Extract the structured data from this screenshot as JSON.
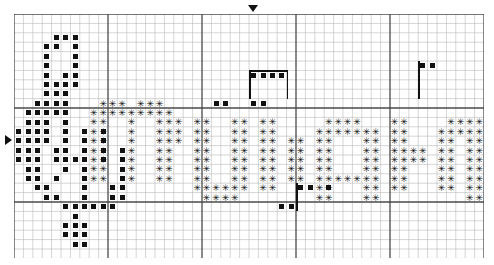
{
  "document": {
    "type": "cross-stitch-pattern-chart",
    "title": "Cross Stitch Pattern Chart",
    "background_color": "#ffffff",
    "symbol_color": "#111111"
  },
  "grid": {
    "columns": 50,
    "rows": 26,
    "cell_size": 9.4,
    "origin_x": 14,
    "origin_y": 14,
    "light_line_color": "#b9b9b9",
    "heavy_line_color": "#4a4a4a",
    "heavy_every": 10,
    "light_width": 0.6,
    "heavy_width": 1.3
  },
  "legend": {
    "symbols": [
      {
        "key": "sq",
        "glyph": "■",
        "name": "filled-square-stitch",
        "color": "#111111"
      },
      {
        "key": "ast",
        "glyph": "✳",
        "name": "asterisk-stitch",
        "color": "#111111"
      }
    ]
  },
  "markers": [
    {
      "name": "center-marker-top",
      "edge": "top",
      "col": 25,
      "icon": "triangle-down-icon"
    },
    {
      "name": "center-marker-left",
      "edge": "left",
      "row": 13,
      "icon": "triangle-right-icon"
    }
  ],
  "backstitch": [
    {
      "name": "backstitch-top-box",
      "type": "h",
      "col": 25,
      "row": 6,
      "length": 4
    },
    {
      "name": "backstitch-top-box-left",
      "type": "v",
      "col": 25,
      "row": 6,
      "length": 3
    },
    {
      "name": "backstitch-top-box-right",
      "type": "v",
      "col": 29,
      "row": 6,
      "length": 3
    },
    {
      "name": "backstitch-right-stem",
      "type": "v",
      "col": 43,
      "row": 5,
      "length": 4
    },
    {
      "name": "backstitch-lower-stem",
      "type": "v",
      "col": 30,
      "row": 18,
      "length": 3
    }
  ],
  "chart_data": {
    "type": "heatmap",
    "xlabel": "",
    "ylabel": "",
    "legend": [
      "filled-square",
      "asterisk"
    ],
    "categories": [],
    "values": [],
    "stitches_sq": [
      [
        4,
        2
      ],
      [
        5,
        2
      ],
      [
        6,
        2
      ],
      [
        3,
        3
      ],
      [
        4,
        3
      ],
      [
        6,
        3
      ],
      [
        3,
        4
      ],
      [
        6,
        4
      ],
      [
        3,
        5
      ],
      [
        6,
        5
      ],
      [
        3,
        6
      ],
      [
        5,
        6
      ],
      [
        6,
        6
      ],
      [
        3,
        7
      ],
      [
        4,
        7
      ],
      [
        5,
        7
      ],
      [
        6,
        7
      ],
      [
        3,
        8
      ],
      [
        4,
        8
      ],
      [
        5,
        8
      ],
      [
        2,
        9
      ],
      [
        3,
        9
      ],
      [
        4,
        9
      ],
      [
        5,
        9
      ],
      [
        1,
        10
      ],
      [
        2,
        10
      ],
      [
        3,
        10
      ],
      [
        4,
        10
      ],
      [
        5,
        10
      ],
      [
        1,
        11
      ],
      [
        2,
        11
      ],
      [
        3,
        11
      ],
      [
        5,
        11
      ],
      [
        0,
        12
      ],
      [
        1,
        12
      ],
      [
        2,
        12
      ],
      [
        3,
        12
      ],
      [
        5,
        12
      ],
      [
        7,
        12
      ],
      [
        9,
        12
      ],
      [
        0,
        13
      ],
      [
        1,
        13
      ],
      [
        2,
        13
      ],
      [
        3,
        13
      ],
      [
        5,
        13
      ],
      [
        7,
        13
      ],
      [
        9,
        13
      ],
      [
        0,
        14
      ],
      [
        1,
        14
      ],
      [
        2,
        14
      ],
      [
        4,
        14
      ],
      [
        5,
        14
      ],
      [
        7,
        14
      ],
      [
        9,
        14
      ],
      [
        11,
        14
      ],
      [
        0,
        15
      ],
      [
        1,
        15
      ],
      [
        2,
        15
      ],
      [
        4,
        15
      ],
      [
        5,
        15
      ],
      [
        6,
        15
      ],
      [
        7,
        15
      ],
      [
        9,
        15
      ],
      [
        11,
        15
      ],
      [
        1,
        16
      ],
      [
        2,
        16
      ],
      [
        5,
        16
      ],
      [
        7,
        16
      ],
      [
        11,
        16
      ],
      [
        1,
        17
      ],
      [
        2,
        17
      ],
      [
        4,
        17
      ],
      [
        7,
        17
      ],
      [
        11,
        17
      ],
      [
        2,
        18
      ],
      [
        3,
        18
      ],
      [
        7,
        18
      ],
      [
        10,
        18
      ],
      [
        11,
        18
      ],
      [
        3,
        19
      ],
      [
        4,
        19
      ],
      [
        7,
        19
      ],
      [
        10,
        19
      ],
      [
        11,
        19
      ],
      [
        5,
        20
      ],
      [
        6,
        20
      ],
      [
        7,
        20
      ],
      [
        8,
        20
      ],
      [
        9,
        20
      ],
      [
        10,
        20
      ],
      [
        6,
        21
      ],
      [
        5,
        22
      ],
      [
        6,
        22
      ],
      [
        7,
        22
      ],
      [
        5,
        23
      ],
      [
        6,
        23
      ],
      [
        7,
        23
      ],
      [
        6,
        24
      ],
      [
        7,
        24
      ],
      [
        25,
        6
      ],
      [
        26,
        6
      ],
      [
        27,
        6
      ],
      [
        28,
        6
      ],
      [
        21,
        9
      ],
      [
        22,
        9
      ],
      [
        25,
        9
      ],
      [
        26,
        9
      ],
      [
        43,
        5
      ],
      [
        44,
        5
      ],
      [
        30,
        18
      ],
      [
        31,
        18
      ],
      [
        33,
        18
      ],
      [
        28,
        20
      ],
      [
        29,
        20
      ]
    ],
    "stitches_ast": [
      [
        9,
        9
      ],
      [
        10,
        9
      ],
      [
        11,
        9
      ],
      [
        13,
        9
      ],
      [
        14,
        9
      ],
      [
        15,
        9
      ],
      [
        8,
        10
      ],
      [
        9,
        10
      ],
      [
        10,
        10
      ],
      [
        11,
        10
      ],
      [
        12,
        10
      ],
      [
        13,
        10
      ],
      [
        14,
        10
      ],
      [
        15,
        10
      ],
      [
        16,
        10
      ],
      [
        8,
        11
      ],
      [
        9,
        11
      ],
      [
        12,
        11
      ],
      [
        15,
        11
      ],
      [
        16,
        11
      ],
      [
        19,
        11
      ],
      [
        20,
        11
      ],
      [
        23,
        11
      ],
      [
        24,
        11
      ],
      [
        33,
        11
      ],
      [
        34,
        11
      ],
      [
        35,
        11
      ],
      [
        36,
        11
      ],
      [
        46,
        11
      ],
      [
        47,
        11
      ],
      [
        48,
        11
      ],
      [
        49,
        11
      ],
      [
        8,
        12
      ],
      [
        9,
        12
      ],
      [
        12,
        12
      ],
      [
        15,
        12
      ],
      [
        16,
        12
      ],
      [
        19,
        12
      ],
      [
        20,
        12
      ],
      [
        23,
        12
      ],
      [
        24,
        12
      ],
      [
        32,
        12
      ],
      [
        33,
        12
      ],
      [
        34,
        12
      ],
      [
        35,
        12
      ],
      [
        36,
        12
      ],
      [
        37,
        12
      ],
      [
        38,
        12
      ],
      [
        45,
        12
      ],
      [
        46,
        12
      ],
      [
        47,
        12
      ],
      [
        48,
        12
      ],
      [
        49,
        12
      ],
      [
        8,
        13
      ],
      [
        9,
        13
      ],
      [
        12,
        13
      ],
      [
        15,
        13
      ],
      [
        16,
        13
      ],
      [
        19,
        13
      ],
      [
        20,
        13
      ],
      [
        23,
        13
      ],
      [
        24,
        13
      ],
      [
        32,
        13
      ],
      [
        33,
        13
      ],
      [
        37,
        13
      ],
      [
        38,
        13
      ],
      [
        45,
        13
      ],
      [
        46,
        13
      ],
      [
        48,
        13
      ],
      [
        49,
        13
      ],
      [
        8,
        14
      ],
      [
        9,
        14
      ],
      [
        12,
        14
      ],
      [
        15,
        14
      ],
      [
        16,
        14
      ],
      [
        19,
        14
      ],
      [
        20,
        14
      ],
      [
        23,
        14
      ],
      [
        24,
        14
      ],
      [
        32,
        14
      ],
      [
        33,
        14
      ],
      [
        37,
        14
      ],
      [
        38,
        14
      ],
      [
        45,
        14
      ],
      [
        46,
        14
      ],
      [
        48,
        14
      ],
      [
        49,
        14
      ],
      [
        8,
        15
      ],
      [
        9,
        15
      ],
      [
        12,
        15
      ],
      [
        15,
        15
      ],
      [
        16,
        15
      ],
      [
        19,
        15
      ],
      [
        20,
        15
      ],
      [
        23,
        15
      ],
      [
        24,
        15
      ],
      [
        32,
        15
      ],
      [
        33,
        15
      ],
      [
        37,
        15
      ],
      [
        38,
        15
      ],
      [
        45,
        15
      ],
      [
        46,
        15
      ],
      [
        48,
        15
      ],
      [
        49,
        15
      ],
      [
        8,
        16
      ],
      [
        9,
        16
      ],
      [
        12,
        16
      ],
      [
        15,
        16
      ],
      [
        16,
        16
      ],
      [
        19,
        16
      ],
      [
        20,
        16
      ],
      [
        23,
        16
      ],
      [
        24,
        16
      ],
      [
        32,
        16
      ],
      [
        33,
        16
      ],
      [
        37,
        16
      ],
      [
        38,
        16
      ],
      [
        45,
        16
      ],
      [
        46,
        16
      ],
      [
        48,
        16
      ],
      [
        49,
        16
      ],
      [
        8,
        17
      ],
      [
        9,
        17
      ],
      [
        12,
        17
      ],
      [
        15,
        17
      ],
      [
        16,
        17
      ],
      [
        19,
        17
      ],
      [
        20,
        17
      ],
      [
        23,
        17
      ],
      [
        24,
        17
      ],
      [
        32,
        17
      ],
      [
        33,
        17
      ],
      [
        34,
        17
      ],
      [
        35,
        17
      ],
      [
        36,
        17
      ],
      [
        37,
        17
      ],
      [
        38,
        17
      ],
      [
        45,
        17
      ],
      [
        46,
        17
      ],
      [
        48,
        17
      ],
      [
        49,
        17
      ],
      [
        19,
        18
      ],
      [
        20,
        18
      ],
      [
        21,
        18
      ],
      [
        22,
        18
      ],
      [
        23,
        18
      ],
      [
        24,
        18
      ],
      [
        32,
        18
      ],
      [
        33,
        18
      ],
      [
        37,
        18
      ],
      [
        38,
        18
      ],
      [
        45,
        18
      ],
      [
        46,
        18
      ],
      [
        48,
        18
      ],
      [
        49,
        18
      ],
      [
        20,
        19
      ],
      [
        21,
        19
      ],
      [
        22,
        19
      ],
      [
        23,
        19
      ],
      [
        32,
        19
      ],
      [
        33,
        19
      ],
      [
        37,
        19
      ],
      [
        38,
        19
      ],
      [
        48,
        19
      ],
      [
        49,
        19
      ],
      [
        17,
        11
      ],
      [
        17,
        12
      ],
      [
        17,
        13
      ],
      [
        26,
        11
      ],
      [
        26,
        12
      ],
      [
        26,
        13
      ],
      [
        26,
        14
      ],
      [
        26,
        15
      ],
      [
        26,
        16
      ],
      [
        26,
        17
      ],
      [
        26,
        18
      ],
      [
        27,
        11
      ],
      [
        27,
        12
      ],
      [
        27,
        13
      ],
      [
        27,
        14
      ],
      [
        27,
        15
      ],
      [
        27,
        16
      ],
      [
        27,
        17
      ],
      [
        27,
        18
      ],
      [
        29,
        13
      ],
      [
        30,
        13
      ],
      [
        29,
        14
      ],
      [
        30,
        14
      ],
      [
        29,
        15
      ],
      [
        30,
        15
      ],
      [
        29,
        16
      ],
      [
        30,
        16
      ],
      [
        29,
        17
      ],
      [
        30,
        17
      ],
      [
        40,
        11
      ],
      [
        41,
        11
      ],
      [
        40,
        12
      ],
      [
        41,
        12
      ],
      [
        40,
        13
      ],
      [
        41,
        13
      ],
      [
        40,
        14
      ],
      [
        41,
        14
      ],
      [
        40,
        15
      ],
      [
        41,
        15
      ],
      [
        40,
        16
      ],
      [
        41,
        16
      ],
      [
        40,
        17
      ],
      [
        41,
        17
      ],
      [
        40,
        18
      ],
      [
        41,
        18
      ],
      [
        42,
        14
      ],
      [
        43,
        14
      ],
      [
        42,
        15
      ],
      [
        43,
        15
      ]
    ]
  }
}
